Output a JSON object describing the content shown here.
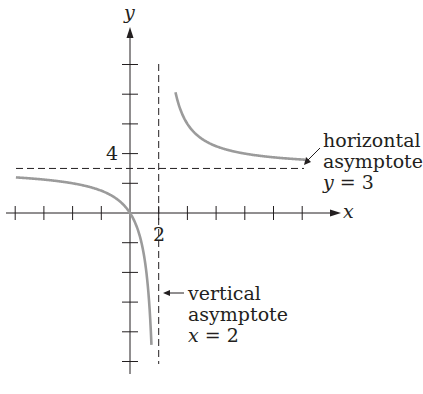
{
  "chart_data": {
    "type": "line",
    "title": "",
    "xlabel": "x",
    "ylabel": "y",
    "function": "y = 3x/(x - 2)",
    "x_tick_step": 2,
    "y_tick_step": 2,
    "x_ticks": [
      -10,
      -8,
      -6,
      -4,
      -2,
      0,
      2,
      4,
      6,
      8,
      10,
      12
    ],
    "y_ticks": [
      -10,
      -8,
      -6,
      -4,
      -2,
      0,
      2,
      4,
      6,
      8,
      10
    ],
    "labeled_ticks": {
      "x": [
        {
          "value": 2,
          "label": "2"
        }
      ],
      "y": [
        {
          "value": 4,
          "label": "4"
        }
      ]
    },
    "xlim": [
      -8,
      14
    ],
    "ylim": [
      -10,
      12.3
    ],
    "grid": false,
    "series": [
      {
        "name": "left branch",
        "color": "#9b9b9b",
        "x": [
          -8,
          -6,
          -4,
          -2,
          0,
          0.5,
          1,
          1.2,
          1.4,
          1.5
        ],
        "y": [
          2.4,
          2.25,
          2.0,
          1.5,
          0,
          -1.0,
          -3.0,
          -4.5,
          -7.0,
          -9.0
        ]
      },
      {
        "name": "right branch",
        "color": "#9b9b9b",
        "x": [
          3.2,
          3.5,
          4,
          5,
          6,
          8,
          10,
          12
        ],
        "y": [
          8.0,
          7.0,
          6.0,
          5.0,
          4.5,
          4.0,
          3.75,
          3.6
        ]
      }
    ],
    "asymptotes": [
      {
        "type": "horizontal",
        "value": 3,
        "style": "dashed"
      },
      {
        "type": "vertical",
        "value": 2,
        "style": "dashed"
      }
    ],
    "annotations": [
      {
        "lines": [
          "horizontal",
          "asymptote",
          "y = 3"
        ],
        "points_to": "horizontal asymptote"
      },
      {
        "lines": [
          "vertical",
          "asymptote",
          "x = 2"
        ],
        "points_to": "vertical asymptote"
      }
    ]
  },
  "labels": {
    "axis_x": "x",
    "axis_y": "y",
    "tick_x_2": "2",
    "tick_y_4": "4",
    "h_asym": {
      "line1": "horizontal",
      "line2": "asymptote",
      "line3_var": "y",
      "line3_rest": " = 3"
    },
    "v_asym": {
      "line1": "vertical",
      "line2": "asymptote",
      "line3_var": "x",
      "line3_rest": " = 2"
    }
  },
  "colors": {
    "axis": "#231f20",
    "curve": "#9b9b9b",
    "dash": "#231f20"
  }
}
